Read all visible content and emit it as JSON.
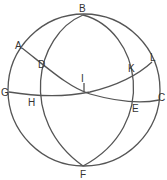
{
  "figure": {
    "labels": {
      "A": "A",
      "B": "B",
      "C": "C",
      "D": "D",
      "E": "E",
      "F": "F",
      "G": "G",
      "H": "H",
      "I": "I",
      "K": "K",
      "L": "L"
    },
    "colors": {
      "stroke": "#555555",
      "text": "#333333",
      "background": "#ffffff"
    }
  }
}
